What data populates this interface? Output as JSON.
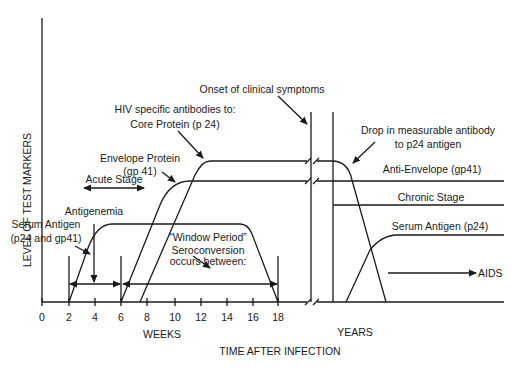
{
  "y_axis_label": "LEVEL OF TEST MARKERS",
  "x_axis_title": "TIME AFTER INFECTION",
  "weeks_label": "WEEKS",
  "years_label": "YEARS",
  "x_ticks": [
    "0",
    "2",
    "4",
    "6",
    "8",
    "10",
    "12",
    "14",
    "16",
    "18"
  ],
  "annotations": {
    "onset": "Onset of clinical symptoms",
    "hiv_antibodies": "HIV specific antibodies to:",
    "core_protein": "Core Protein (p 24)",
    "envelope_protein_1": "Envelope Protein",
    "envelope_protein_2": "(gp 41)",
    "acute_stage": "Acute Stage",
    "antigenemia": "Antigenemia",
    "serum_antigen_1": "Serum Antigen",
    "serum_antigen_2": "(p24 and gp41)",
    "window_1": "“Window Period”",
    "window_2": "Seroconversion",
    "window_3": "occurs between:",
    "drop_1": "Drop in  measurable antibody",
    "drop_2": "to p24 antigen",
    "anti_envelope": "Anti-Envelope (gp41)",
    "chronic_stage": "Chronic Stage",
    "serum_antigen_p24": "Serum Antigen (p24)",
    "aids": "AIDS"
  }
}
